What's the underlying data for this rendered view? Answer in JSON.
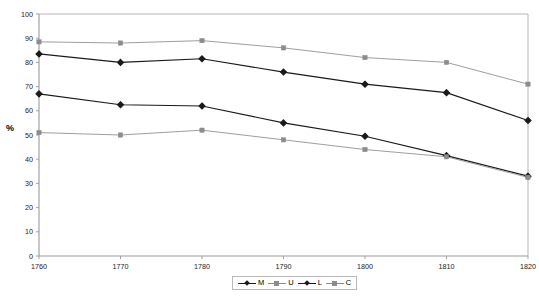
{
  "chart_data": {
    "type": "line",
    "title": "",
    "xlabel": "",
    "ylabel": "%",
    "x": [
      1760,
      1770,
      1780,
      1790,
      1800,
      1810,
      1820
    ],
    "xticklabels": [
      "1760",
      "1770",
      "1780",
      "1790",
      "1800",
      "1810",
      "1820"
    ],
    "yticklabels": [
      "0",
      "10",
      "20",
      "30",
      "40",
      "50",
      "60",
      "70",
      "80",
      "90",
      "100"
    ],
    "ylim": [
      0,
      100
    ],
    "xlim": [
      1760,
      1820
    ],
    "ytick_step": 10,
    "grid": false,
    "legend_position": "bottom-center",
    "series": [
      {
        "name": "M",
        "color": "#1a1a1a",
        "marker": "diamond",
        "values": [
          83.5,
          80.0,
          81.5,
          76.0,
          71.0,
          67.5,
          56.0
        ]
      },
      {
        "name": "U",
        "color": "#8c8c8c",
        "marker": "square",
        "values": [
          88.5,
          88.0,
          89.0,
          86.0,
          82.0,
          80.0,
          71.0
        ]
      },
      {
        "name": "L",
        "color": "#1a1a1a",
        "marker": "diamond",
        "values": [
          67.0,
          62.5,
          62.0,
          55.0,
          49.5,
          41.5,
          33.0
        ]
      },
      {
        "name": "C",
        "color": "#8c8c8c",
        "marker": "square",
        "values": [
          51.0,
          50.0,
          52.0,
          48.0,
          44.0,
          41.0,
          32.5
        ]
      }
    ]
  },
  "legend": {
    "entries": [
      {
        "label": "M"
      },
      {
        "label": "U"
      },
      {
        "label": "L"
      },
      {
        "label": "C"
      }
    ]
  },
  "axis": {
    "y_title": "%"
  }
}
